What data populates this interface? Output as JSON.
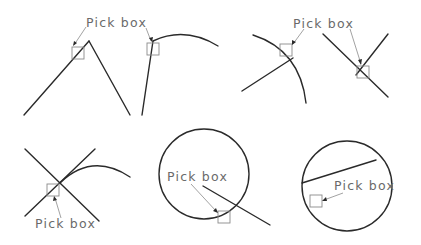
{
  "diagram": {
    "title": "",
    "label_text": "Pick box",
    "colors": {
      "geometry": "#2a2a2a",
      "pickbox": "#8a8a8a",
      "label": "#6a6a6a",
      "background": "#ffffff"
    },
    "panels": [
      {
        "id": 1,
        "description": "Two lines meeting at an apex; pick box on left line near apex",
        "label": "Pick box"
      },
      {
        "id": 2,
        "description": "Line meeting an arc at an endpoint; pick box on line near endpoint",
        "label_shared_with": 1
      },
      {
        "id": 3,
        "description": "Line ending on an arc; pick box on arc near intersection",
        "label": "Pick box"
      },
      {
        "id": 4,
        "description": "Two lines intersecting; pick box on intersection",
        "label_shared_with": 3
      },
      {
        "id": 5,
        "description": "Two crossing lines and an arc from the intersection; pick box below intersection",
        "label": "Pick box"
      },
      {
        "id": 6,
        "description": "Circle with a line crossing it; pick box at circle/line intersection",
        "label": "Pick box"
      },
      {
        "id": 7,
        "description": "Circle with a chord line; pick box on circle edge",
        "label": "Pick box"
      }
    ],
    "labels": [
      {
        "id": "top-left",
        "text": "Pick box"
      },
      {
        "id": "top-right",
        "text": "Pick box"
      },
      {
        "id": "bottom-left",
        "text": "Pick box"
      },
      {
        "id": "bottom-middle",
        "text": "Pick box"
      },
      {
        "id": "bottom-right",
        "text": "Pick box"
      }
    ]
  }
}
